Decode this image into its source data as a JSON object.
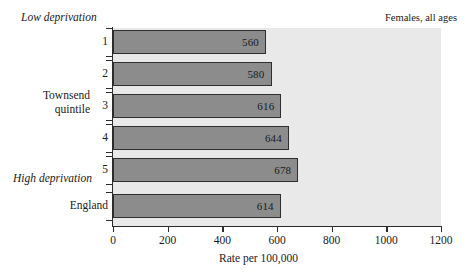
{
  "annotations": {
    "low_deprivation": "Low deprivation",
    "high_deprivation": "High deprivation",
    "series_note": "Females, all ages"
  },
  "axes": {
    "category_group_title_line1": "Townsend",
    "category_group_title_line2": "quintile",
    "value_axis_title": "Rate per 100,000",
    "value_ticks": [
      "0",
      "200",
      "400",
      "600",
      "800",
      "1000",
      "1200"
    ]
  },
  "bars": [
    {
      "label": "1",
      "value": 560,
      "value_text": "560"
    },
    {
      "label": "2",
      "value": 580,
      "value_text": "580"
    },
    {
      "label": "3",
      "value": 616,
      "value_text": "616"
    },
    {
      "label": "4",
      "value": 644,
      "value_text": "644"
    },
    {
      "label": "5",
      "value": 678,
      "value_text": "678"
    },
    {
      "label": "England",
      "value": 614,
      "value_text": "614"
    }
  ],
  "colors": {
    "bar_fill": "#8c8c8c",
    "bar_stroke": "#2e2e2e",
    "plot_background": "#e9e9e9",
    "axis": "#2b2b2b",
    "text": "#1a1a1a"
  },
  "chart_data": {
    "type": "bar",
    "orientation": "horizontal",
    "title": "",
    "subtitle": "",
    "annotation_top_left": "Low deprivation",
    "annotation_bottom_left": "High deprivation",
    "annotation_top_right": "Females, all ages",
    "categories": [
      "1",
      "2",
      "3",
      "4",
      "5",
      "England"
    ],
    "category_axis_label": "Townsend quintile",
    "values": [
      560,
      580,
      616,
      644,
      678,
      614
    ],
    "data_labels": [
      "560",
      "580",
      "616",
      "644",
      "678",
      "614"
    ],
    "xlabel": "Rate per 100,000",
    "ylabel": "Townsend quintile",
    "xlim": [
      0,
      1200
    ],
    "xticks": [
      0,
      200,
      400,
      600,
      800,
      1000,
      1200
    ],
    "grid": false,
    "legend": "none"
  }
}
